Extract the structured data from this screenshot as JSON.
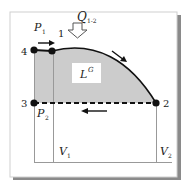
{
  "diagram": {
    "type": "pV-diagram",
    "colors": {
      "frame": "#cfcfcf",
      "frame_shadow": "#8a8a8a",
      "fill": "#cccccc",
      "line": "#111111",
      "guide": "#999999",
      "label_box": "#ffffff"
    },
    "points": [
      {
        "id": "4",
        "label": "4"
      },
      {
        "id": "1",
        "label": "1"
      },
      {
        "id": "2",
        "label": "2"
      },
      {
        "id": "3",
        "label": "3"
      }
    ],
    "pressure_labels": {
      "p1": "P",
      "p1_sub": "1",
      "p2": "P",
      "p2_sub": "2"
    },
    "volume_labels": {
      "v1": "V",
      "v1_sub": "1",
      "v2": "V",
      "v2_sub": "2"
    },
    "heat": {
      "symbol": "Q",
      "sub": "1-2"
    },
    "work": {
      "symbol": "L",
      "sup": "G"
    }
  }
}
